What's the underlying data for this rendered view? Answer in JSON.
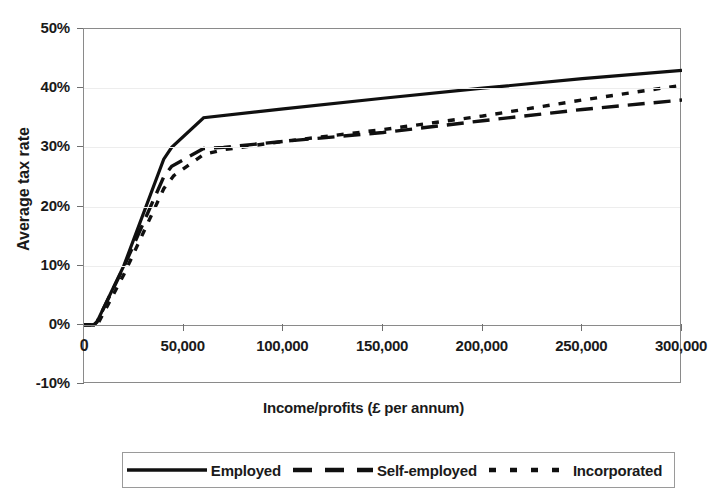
{
  "chart_data": {
    "type": "line",
    "title": "",
    "xlabel": "Income/profits (£ per annum)",
    "ylabel": "Average tax rate",
    "xlim": [
      0,
      300000
    ],
    "ylim": [
      -0.1,
      0.5
    ],
    "grid": true,
    "legend_position": "bottom",
    "xticks": [
      0,
      50000,
      100000,
      150000,
      200000,
      250000,
      300000
    ],
    "xtick_labels": [
      "0",
      "50,000",
      "100,000",
      "150,000",
      "200,000",
      "250,000",
      "300,000"
    ],
    "yticks": [
      -0.1,
      0.0,
      0.1,
      0.2,
      0.3,
      0.4,
      0.5
    ],
    "ytick_labels": [
      "-10%",
      "0%",
      "10%",
      "20%",
      "30%",
      "40%",
      "50%"
    ],
    "series": [
      {
        "name": "Employed",
        "style": "solid",
        "color": "#101010",
        "x": [
          0,
          5000,
          6500,
          20000,
          40000,
          44000,
          60000,
          100000,
          150000,
          200000,
          250000,
          300000
        ],
        "y": [
          0.0,
          0.0,
          0.005,
          0.1,
          0.28,
          0.3,
          0.35,
          0.365,
          0.383,
          0.4,
          0.416,
          0.43
        ]
      },
      {
        "name": "Self-employed",
        "style": "dashed",
        "color": "#101010",
        "x": [
          0,
          5000,
          6500,
          20000,
          40000,
          44000,
          60000,
          70000,
          100000,
          150000,
          200000,
          250000,
          300000
        ],
        "y": [
          0.0,
          0.0,
          0.005,
          0.098,
          0.25,
          0.268,
          0.298,
          0.3,
          0.31,
          0.325,
          0.345,
          0.364,
          0.38
        ]
      },
      {
        "name": "Incorporated",
        "style": "dotted",
        "color": "#101010",
        "x": [
          0,
          5000,
          7000,
          20000,
          40000,
          45000,
          60000,
          70000,
          100000,
          150000,
          200000,
          250000,
          300000
        ],
        "y": [
          0.0,
          0.0,
          0.002,
          0.085,
          0.23,
          0.252,
          0.288,
          0.296,
          0.31,
          0.33,
          0.353,
          0.38,
          0.405
        ]
      }
    ]
  },
  "legend": {
    "entries": [
      {
        "label": "Employed",
        "style": "solid"
      },
      {
        "label": "Self-employed",
        "style": "dashed"
      },
      {
        "label": "Incorporated",
        "style": "dotted"
      }
    ]
  }
}
